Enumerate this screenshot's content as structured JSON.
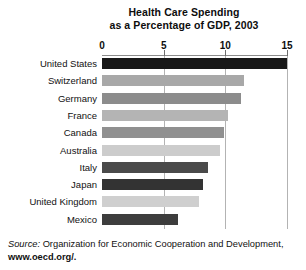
{
  "chart_data": {
    "type": "bar",
    "orientation": "horizontal",
    "title": "Health Care Spending as a Percentage of GDP, 2003",
    "title_lines": [
      "Health Care Spending",
      "as a Percentage of GDP, 2003"
    ],
    "xlabel": "",
    "ylabel": "",
    "xlim": [
      0,
      15
    ],
    "xticks": [
      0,
      5,
      10,
      15
    ],
    "xtick_labels": [
      "0",
      "5",
      "10",
      "15"
    ],
    "grid": true,
    "grid_axis": "x",
    "legend": "none",
    "categories": [
      "United States",
      "Switzerland",
      "Germany",
      "France",
      "Canada",
      "Australia",
      "Italy",
      "Japan",
      "United Kingdom",
      "Mexico"
    ],
    "values": [
      15.0,
      11.5,
      11.3,
      10.2,
      9.9,
      9.6,
      8.6,
      8.2,
      7.9,
      6.2
    ],
    "bar_colors": [
      "#181818",
      "#a8a8a8",
      "#8c8c8c",
      "#b4b4b4",
      "#909090",
      "#cccccc",
      "#4a4a4a",
      "#333333",
      "#cfcfcf",
      "#3d3d3d"
    ],
    "series": [
      {
        "name": "Health care spending (% of GDP)",
        "values": [
          15.0,
          11.5,
          11.3,
          10.2,
          9.9,
          9.6,
          8.6,
          8.2,
          7.9,
          6.2
        ]
      }
    ]
  },
  "source": {
    "lead": "Source:",
    "text": "Organization for Economic Cooperation and Development,",
    "url": "www.oecd.org/",
    "trailing": "."
  },
  "colors": {
    "background": "#ffffff",
    "text": "#111111",
    "gridline": "#b3b3b3",
    "axis": "#8c8c8c"
  }
}
